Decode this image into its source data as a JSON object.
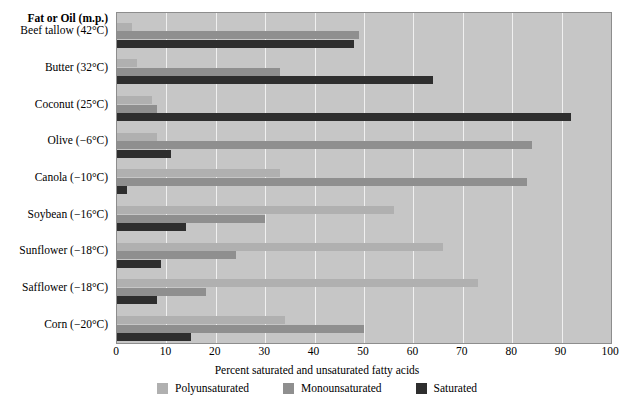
{
  "header": {
    "category_header": "Fat or Oil (m.p.)"
  },
  "legend": {
    "position": "bottom-center",
    "items": [
      {
        "label": "Polyunsaturated",
        "color": "#b0b0b0",
        "swatch_name": "legend-swatch-polyunsaturated"
      },
      {
        "label": "Monounsaturated",
        "color": "#8f8f8f",
        "swatch_name": "legend-swatch-monounsaturated"
      },
      {
        "label": "Saturated",
        "color": "#2e2e2e",
        "swatch_name": "legend-swatch-saturated"
      }
    ]
  },
  "axis": {
    "x_title": "Percent saturated and unsaturated fatty acids",
    "ticks": [
      "0",
      "10",
      "20",
      "30",
      "40",
      "50",
      "60",
      "70",
      "80",
      "90",
      "100"
    ]
  },
  "chart_data": {
    "type": "bar",
    "orientation": "horizontal",
    "title": "",
    "subtitle": "",
    "xlabel": "Percent saturated and unsaturated fatty acids",
    "ylabel": "Fat or Oil (m.p.)",
    "xlim": [
      0,
      100
    ],
    "ylim": null,
    "grid": true,
    "grid_axis": "x",
    "legend_position": "bottom-center",
    "categories": [
      "Beef tallow (42°C)",
      "Butter (32°C)",
      "Coconut (25°C)",
      "Olive (−6°C)",
      "Canola (−10°C)",
      "Soybean (−16°C)",
      "Sunflower (−18°C)",
      "Safflower (−18°C)",
      "Corn (−20°C)"
    ],
    "series": [
      {
        "name": "Polyunsaturated",
        "color": "#b0b0b0",
        "values": [
          3,
          4,
          7,
          8,
          33,
          56,
          66,
          73,
          34
        ]
      },
      {
        "name": "Monounsaturated",
        "color": "#8f8f8f",
        "values": [
          49,
          33,
          8,
          84,
          83,
          30,
          24,
          18,
          50
        ]
      },
      {
        "name": "Saturated",
        "color": "#2e2e2e",
        "values": [
          48,
          64,
          92,
          11,
          2,
          14,
          9,
          8,
          15
        ]
      }
    ]
  }
}
